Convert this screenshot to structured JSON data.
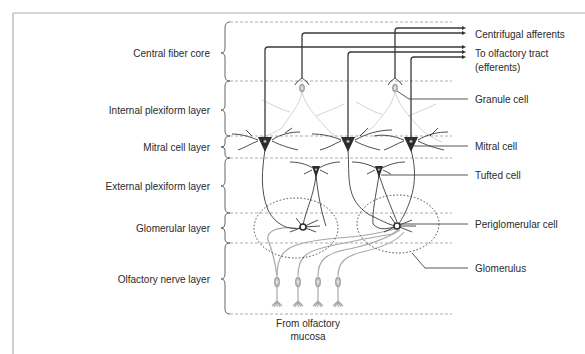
{
  "layers": [
    {
      "id": "central-fiber-core",
      "label": "Central fiber core"
    },
    {
      "id": "internal-plexiform-layer",
      "label": "Internal plexiform layer"
    },
    {
      "id": "mitral-cell-layer",
      "label": "Mitral cell layer"
    },
    {
      "id": "external-plexiform-layer",
      "label": "External plexiform layer"
    },
    {
      "id": "glomerular-layer",
      "label": "Glomerular layer"
    },
    {
      "id": "olfactory-nerve-layer",
      "label": "Olfactory nerve layer"
    }
  ],
  "callouts": {
    "centrifugal": "Centrifugal afferents",
    "tract_line1": "To olfactory tract",
    "tract_line2": "(efferents)",
    "granule": "Granule cell",
    "mitral": "Mitral cell",
    "tufted": "Tufted cell",
    "periglomerular": "Periglomerular cell",
    "glomerulus": "Glomerulus"
  },
  "source": {
    "line1": "From olfactory",
    "line2": "mucosa"
  },
  "colors": {
    "dark_cell": "#2e2e2e",
    "light_cell": "#bdbdbd",
    "frame": "#b0b0b0"
  }
}
